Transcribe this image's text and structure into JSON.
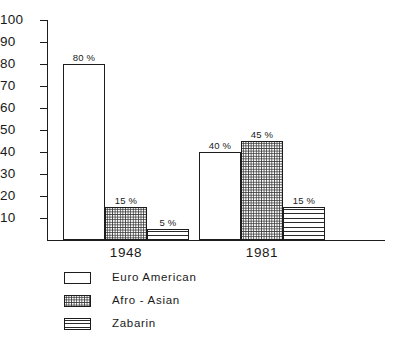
{
  "chart_data": {
    "type": "bar",
    "title": "",
    "subtitle": "",
    "xlabel": "",
    "ylabel": "",
    "categories": [
      "1948",
      "1981"
    ],
    "series": [
      {
        "name": "Euro American",
        "pattern": "open",
        "values": [
          80,
          40
        ],
        "labels": [
          "80 %",
          "40 %"
        ]
      },
      {
        "name": "Afro - Asian",
        "pattern": "dots",
        "values": [
          15,
          45
        ],
        "labels": [
          "15 %",
          "45 %"
        ]
      },
      {
        "name": "Zabarin",
        "pattern": "hlines",
        "values": [
          5,
          15
        ],
        "labels": [
          "5 %",
          "15 %"
        ]
      }
    ],
    "ylim": [
      0,
      100
    ],
    "yticks": [
      10,
      20,
      30,
      40,
      50,
      60,
      70,
      80,
      90,
      100
    ],
    "ytick_labels": [
      "10",
      "20",
      "30",
      "40",
      "50",
      "60",
      "70",
      "80",
      "90",
      "100"
    ],
    "grid": false,
    "legend_position": "below-left",
    "colors": {
      "line": "#1c1c1c",
      "fill": "#ffffff",
      "hatch": "#3a3a3a",
      "text": "#1a1a1a"
    }
  },
  "legend": {
    "items": [
      {
        "label": "Euro American",
        "pattern": "open"
      },
      {
        "label": "Afro - Asian",
        "pattern": "dots"
      },
      {
        "label": "Zabarin",
        "pattern": "hlines"
      }
    ]
  }
}
